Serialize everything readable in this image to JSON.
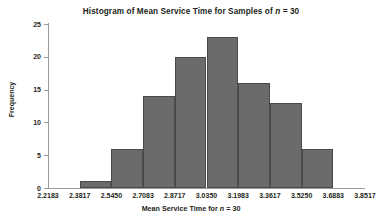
{
  "chart_data": {
    "type": "bar",
    "title": "Histogram of Mean Service Time for Samples of n = 30",
    "title_prefix": "Histogram of Mean Service Time for Samples of ",
    "title_italic": "n",
    "title_suffix": " = 30",
    "xlabel": "Mean Service Time for n = 30",
    "xlabel_prefix": "Mean Service Time for ",
    "xlabel_italic": "n",
    "xlabel_suffix": " = 30",
    "ylabel": "Frequency",
    "xlim": [
      2.2183,
      3.8517
    ],
    "ylim": [
      0,
      25
    ],
    "grid": false,
    "legend": false,
    "bin_width": 0.16334,
    "bin_edges": [
      2.2183,
      2.3817,
      2.545,
      2.7083,
      2.8717,
      3.035,
      3.1983,
      3.3617,
      3.525,
      3.6883,
      3.8517
    ],
    "x_tick_labels": [
      "2.2183",
      "2.3817",
      "2.5450",
      "2.7083",
      "2.8717",
      "3.0350",
      "3.1983",
      "3.3617",
      "3.5250",
      "3.6883",
      "3.8517"
    ],
    "y_tick_labels": [
      "0",
      "5",
      "10",
      "15",
      "20",
      "25"
    ],
    "y_ticks": [
      0,
      5,
      10,
      15,
      20,
      25
    ],
    "categories": [
      "2.2183-2.3817",
      "2.3817-2.5450",
      "2.5450-2.7083",
      "2.7083-2.8717",
      "2.8717-3.0350",
      "3.0350-3.1983",
      "3.1983-3.3617",
      "3.3617-3.5250",
      "3.5250-3.6883",
      "3.6883-3.8517"
    ],
    "values": [
      0,
      1,
      6,
      14,
      20,
      23,
      16,
      13,
      6,
      0
    ],
    "bar_fill_color": "#6b6b6b",
    "bar_edge_color": "#4a4a4a",
    "axis_color": "#9b9b9b",
    "text_color": "#231f20",
    "background_color": "#ffffff"
  }
}
